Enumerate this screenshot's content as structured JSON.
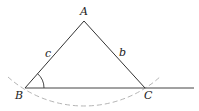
{
  "diagram": {
    "type": "triangle-construction",
    "vertices": [
      {
        "name": "A",
        "label": "A"
      },
      {
        "name": "B",
        "label": "B"
      },
      {
        "name": "C",
        "label": "C"
      }
    ],
    "sides": [
      {
        "name": "c",
        "label": "c",
        "between": "A-B"
      },
      {
        "name": "b",
        "label": "b",
        "between": "A-C"
      }
    ],
    "angle_marker": {
      "at": "B"
    },
    "dashed_arc": {
      "through": [
        "B",
        "C"
      ]
    },
    "colors": {
      "line": "#333333",
      "dashed_arc": "#b0b0b0",
      "text": "#222222"
    }
  }
}
